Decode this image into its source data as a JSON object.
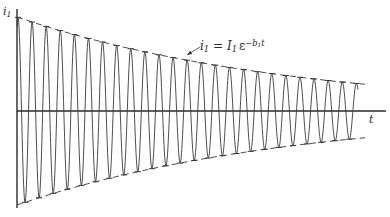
{
  "figure": {
    "type": "damped-oscillation-diagram",
    "y_axis_label": "i",
    "y_axis_label_sub": "1",
    "x_axis_label": "t",
    "equation": {
      "lhs": "i",
      "lhs_sub": "1",
      "equals": " = ",
      "coef": "I",
      "coef_sub": "1",
      "base": "ε",
      "exponent": "−b",
      "exponent_sub": "1",
      "exponent_tail": "t"
    },
    "colors": {
      "line": "#3a3a3a",
      "axis": "#2a2a2a",
      "background": "#ffffff"
    }
  },
  "geometry": {
    "origin_x": 17,
    "axis_y": 111,
    "y_axis_top": 9,
    "y_axis_bottom": 208,
    "x_axis_end": 386,
    "initial_amplitude": 94,
    "decay_rate": 0.00362,
    "period_px": 14.1,
    "wave_end_x": 358,
    "envelope_end_x": 365,
    "cycles": 24
  },
  "annotation": {
    "leader_from": [
      200,
      47
    ],
    "leader_to": [
      187,
      55
    ]
  }
}
